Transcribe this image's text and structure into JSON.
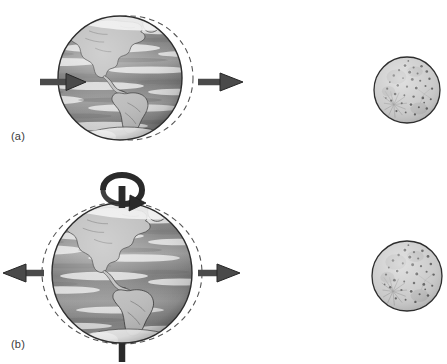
{
  "figure": {
    "type": "scientific-diagram",
    "style": "grayscale halftone line art",
    "background_color": "#ffffff",
    "width": 447,
    "height": 364
  },
  "colors": {
    "ink": "#2b2b2b",
    "arrow_fill": "#4a4a4a",
    "arrow_stroke": "#262626",
    "dashed_outline": "#555555",
    "globe_outline": "#2e2e2e",
    "ocean_mid": "#8d8d8d",
    "ocean_dark": "#6b6b6b",
    "cloud_light": "#e8e8e8",
    "land_fill": "#b9b9b9",
    "land_stroke": "#3a3a3a",
    "polar_ice": "#f4f4f4",
    "moon_fill": "#c9c9c9",
    "moon_outline": "#2e2e2e",
    "crater_dark": "#5a5a5a",
    "axis_rod": "#2a2a2a"
  },
  "panels": [
    {
      "id": "a",
      "label": "(a)",
      "caption_text": "(a)",
      "description": "Earth with uniform rightward force arrows and dashed circle offset toward the Moon",
      "earth": {
        "center_x": 120,
        "center_y": 78,
        "radius": 62,
        "name": "earth-globe",
        "hemisphere_shown": "Americas"
      },
      "dashed_outline": {
        "name": "displaced-outline",
        "center_x": 130,
        "center_y": 78,
        "radius_x": 63,
        "radius_y": 62,
        "style": "dashed",
        "meaning": "undeformed reference position, offset toward Moon"
      },
      "arrows": [
        {
          "name": "arrow-interior-right",
          "direction": "right",
          "x1": 38,
          "y1": 82,
          "x2": 82,
          "y2": 82,
          "location": "inside-globe-left"
        },
        {
          "name": "arrow-exterior-right",
          "direction": "right",
          "x1": 196,
          "y1": 82,
          "x2": 243,
          "y2": 82,
          "location": "outside-globe-right"
        }
      ],
      "moon": {
        "name": "moon-sphere",
        "center_x": 407,
        "center_y": 90,
        "radius": 33
      }
    },
    {
      "id": "b",
      "label": "(b)",
      "caption_text": "(b)",
      "description": "Earth stretched into tidal bulge with outward arrows both sides, rotation axis and spin arrow",
      "earth": {
        "center_x": 122,
        "center_y": 273,
        "radius": 70,
        "name": "earth-globe",
        "hemisphere_shown": "Americas"
      },
      "dashed_outline": {
        "name": "tidal-bulge-outline",
        "center_x": 122,
        "center_y": 273,
        "radius_x": 80,
        "radius_y": 71,
        "style": "dashed",
        "meaning": "elongated tidal bulge, concentric ellipse"
      },
      "arrows": [
        {
          "name": "arrow-tidal-left",
          "direction": "left",
          "x1": 44,
          "y1": 273,
          "x2": 4,
          "y2": 273,
          "location": "outside-globe-left"
        },
        {
          "name": "arrow-tidal-right",
          "direction": "right",
          "x1": 198,
          "y1": 273,
          "x2": 240,
          "y2": 273,
          "location": "outside-globe-right"
        }
      ],
      "rotation_axis": {
        "name": "rotation-axis",
        "north_rod": {
          "x": 122,
          "y_top": 188,
          "y_bottom": 210
        },
        "south_rod": {
          "x": 122,
          "y_top": 338,
          "y_bottom": 362
        },
        "spin_arrow": {
          "name": "spin-arrow",
          "center_x": 122,
          "center_y": 192,
          "meaning": "Earth rotation direction"
        }
      },
      "moon": {
        "name": "moon-sphere",
        "center_x": 407,
        "center_y": 276,
        "radius": 35
      }
    }
  ]
}
